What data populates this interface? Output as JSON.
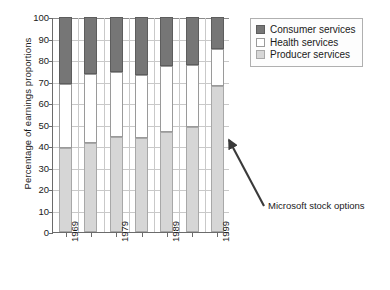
{
  "chart_data": {
    "type": "bar",
    "title": "",
    "subtitle": "",
    "xlabel": "",
    "ylabel": "Percentage of earnings proportions",
    "ylim": [
      0,
      100
    ],
    "yticks": [
      0,
      10,
      20,
      30,
      40,
      50,
      60,
      70,
      80,
      90,
      100
    ],
    "grid": true,
    "stacked": true,
    "legend_position": "top-right",
    "categories": [
      "1969",
      "1974",
      "1979",
      "1984",
      "1989",
      "1994",
      "1999"
    ],
    "tick_labels": [
      "1969",
      "",
      "1979",
      "",
      "1989",
      "",
      "1999"
    ],
    "series": [
      {
        "name": "Producer services",
        "color": "#d6d6d6",
        "values": [
          39,
          41.5,
          44,
          43.5,
          46.5,
          49,
          68
        ]
      },
      {
        "name": "Health services",
        "color": "#ffffff",
        "values": [
          30,
          32,
          30.5,
          29.5,
          30.5,
          28.5,
          17
        ]
      },
      {
        "name": "Consumer services",
        "color": "#767676",
        "values": [
          31,
          26.5,
          25.5,
          27,
          23,
          22.5,
          15
        ]
      }
    ],
    "cumulative_tops": {
      "producer": [
        39,
        41.5,
        44,
        43.5,
        46.5,
        49,
        68
      ],
      "health": [
        69,
        73.5,
        74.5,
        73,
        77,
        77.5,
        85
      ],
      "consumer": [
        100,
        100,
        100,
        100,
        100,
        100,
        100
      ]
    },
    "annotations": [
      {
        "text": "Microsoft stock options",
        "points_to_category": "1999",
        "points_to_value": 58
      }
    ]
  },
  "legend": {
    "items": [
      {
        "label": "Consumer services",
        "color": "#767676"
      },
      {
        "label": "Health services",
        "color": "#ffffff"
      },
      {
        "label": "Producer services",
        "color": "#d6d6d6"
      }
    ]
  },
  "axis": {
    "y_title": "Percentage of earnings proportions",
    "y_ticks": [
      "100",
      "90",
      "80",
      "70",
      "60",
      "50",
      "40",
      "30",
      "20",
      "10",
      "0"
    ],
    "x_ticks": [
      "1969",
      "1979",
      "1989",
      "1999"
    ]
  },
  "annotation": {
    "label": "Microsoft stock options"
  }
}
